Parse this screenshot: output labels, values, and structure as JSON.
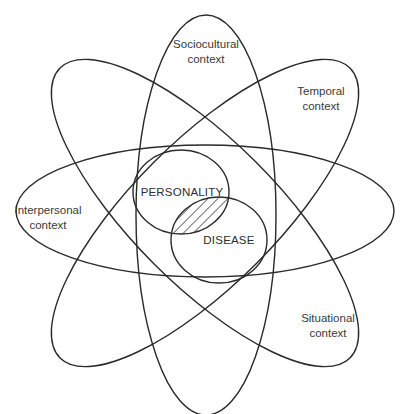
{
  "diagram": {
    "contexts": [
      {
        "id": "sociocultural",
        "line1": "Sociocultural",
        "line2": "context"
      },
      {
        "id": "temporal",
        "line1": "Temporal",
        "line2": "context"
      },
      {
        "id": "interpersonal",
        "line1": "Interpersonal",
        "line2": "context"
      },
      {
        "id": "situational",
        "line1": "Situational",
        "line2": "context"
      }
    ],
    "core": {
      "personality": "PERSONALITY",
      "disease": "DISEASE"
    },
    "colors": {
      "stroke": "#2a2a2a",
      "text": "#3a3a3a",
      "background": "#ffffff"
    }
  }
}
